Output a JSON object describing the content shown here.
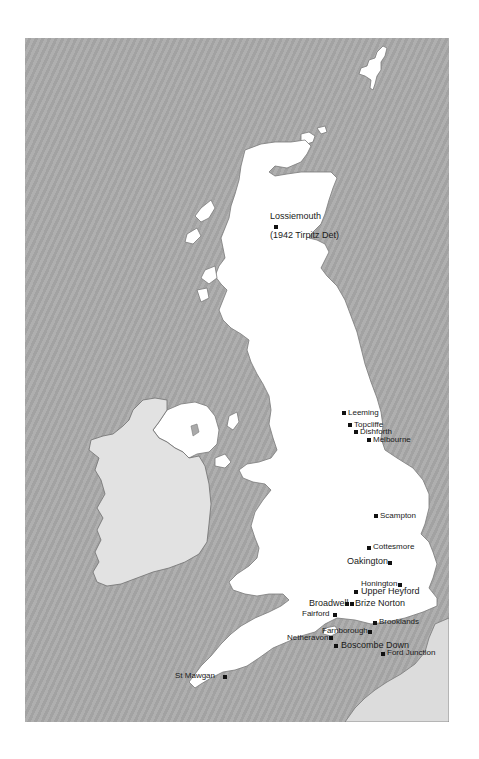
{
  "map": {
    "title": "",
    "colors": {
      "sea": "#a9a9a9",
      "uk_land": "#ffffff",
      "ireland_land": "#e2e2e2",
      "france_land": "#dcdcdc",
      "marker": "#111111",
      "label": "#1a1a1a"
    },
    "regions": [
      "Great Britain",
      "Northern Ireland",
      "Republic of Ireland",
      "Shetland",
      "Orkney",
      "France"
    ],
    "airfields": [
      {
        "name": "Lossiemouth",
        "note": "(1942 Tirpitz Det)"
      },
      {
        "name": "Leeming"
      },
      {
        "name": "Topcliffe"
      },
      {
        "name": "Dishforth"
      },
      {
        "name": "Melbourne"
      },
      {
        "name": "Scampton"
      },
      {
        "name": "Cottesmore"
      },
      {
        "name": "Oakington"
      },
      {
        "name": "Honington"
      },
      {
        "name": "Upper Heyford"
      },
      {
        "name": "Broadwell"
      },
      {
        "name": "Brize Norton"
      },
      {
        "name": "Fairford"
      },
      {
        "name": "Brooklands"
      },
      {
        "name": "Farnborough"
      },
      {
        "name": "Netheravon"
      },
      {
        "name": "Boscombe Down"
      },
      {
        "name": "Ford Junction"
      },
      {
        "name": "St Mawgan"
      }
    ]
  }
}
